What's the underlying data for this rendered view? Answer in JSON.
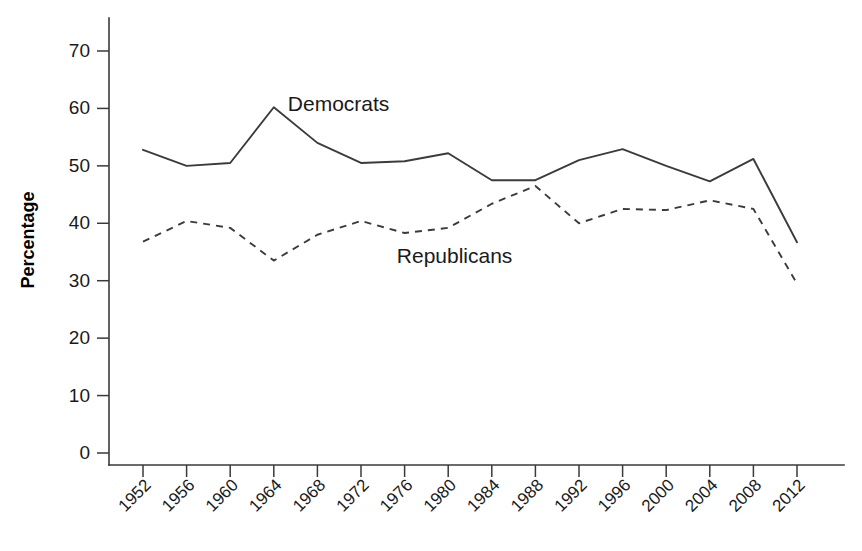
{
  "chart_data": {
    "type": "line",
    "title": "",
    "subtitle": "",
    "xlabel": "",
    "ylabel": "Percentage",
    "x": [
      1952,
      1956,
      1960,
      1964,
      1968,
      1972,
      1976,
      1980,
      1984,
      1988,
      1992,
      1996,
      2000,
      2004,
      2008,
      2012
    ],
    "categories": [
      "1952",
      "1956",
      "1960",
      "1964",
      "1968",
      "1972",
      "1976",
      "1980",
      "1984",
      "1988",
      "1992",
      "1996",
      "2000",
      "2004",
      "2008",
      "2012"
    ],
    "series": [
      {
        "name": "Democrats",
        "style": "solid",
        "color": "#3b3b3b",
        "values": [
          52.8,
          50.0,
          50.5,
          60.2,
          54.0,
          50.5,
          50.8,
          52.2,
          47.5,
          47.5,
          51.0,
          52.9,
          50.0,
          47.3,
          51.2,
          36.7
        ]
      },
      {
        "name": "Republicans",
        "style": "dashed",
        "color": "#3b3b3b",
        "values": [
          36.8,
          40.4,
          39.2,
          33.5,
          38.0,
          40.4,
          38.3,
          39.2,
          43.4,
          46.5,
          40.0,
          42.5,
          42.3,
          44.0,
          42.5,
          29.5
        ]
      }
    ],
    "ylim": [
      0,
      75
    ],
    "yticks": [
      0,
      10,
      20,
      30,
      40,
      50,
      60,
      70
    ],
    "ytick_labels": [
      "0",
      "10",
      "20",
      "30",
      "40",
      "50",
      "60",
      "70"
    ],
    "grid": false,
    "legend_position": "inline-annotations",
    "annotations": [
      {
        "text": "Democrats",
        "x": 1964,
        "y": 59.5
      },
      {
        "text": "Republicans",
        "x": 1974,
        "y": 33.0
      }
    ],
    "xtick_rotation_deg": 45
  }
}
